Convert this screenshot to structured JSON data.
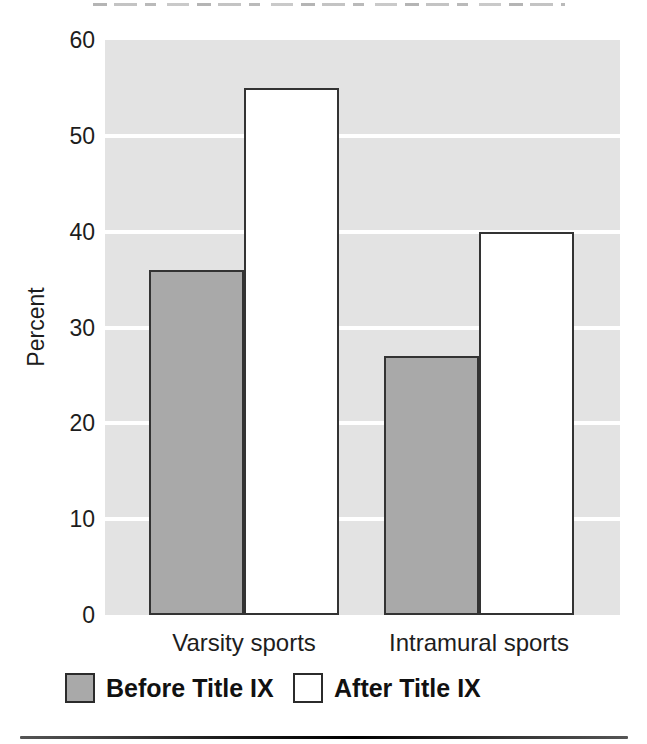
{
  "figure": {
    "background": "#ffffff",
    "text_color": "#1d1d1d"
  },
  "chart_data": {
    "type": "bar",
    "categories": [
      "Varsity sports",
      "Intramural sports"
    ],
    "series": [
      {
        "name": "Before Title IX",
        "values": [
          36,
          27
        ],
        "fill": "#a9a9a9"
      },
      {
        "name": "After Title IX",
        "values": [
          55,
          40
        ],
        "fill": "#ffffff"
      }
    ],
    "xlabel": "",
    "ylabel": "Percent",
    "ylim": [
      0,
      60
    ],
    "yticks": [
      60,
      50,
      40,
      30,
      20,
      10,
      0
    ],
    "ytick_labels": [
      "60",
      "50",
      "40",
      "30",
      "20",
      "10",
      "0"
    ],
    "grid": "horizontal",
    "gridline_color": "#ffffff",
    "plot_background": "#e3e3e3",
    "bar_border_color": "#333333",
    "legend_position": "bottom"
  }
}
